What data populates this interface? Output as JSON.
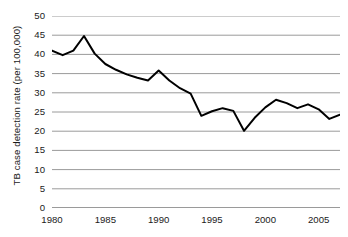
{
  "chart_data": {
    "type": "line",
    "title": "",
    "xlabel": "",
    "ylabel": "TB case detection rate (per 100,000)",
    "xlim": [
      1980,
      2007
    ],
    "ylim": [
      0,
      50
    ],
    "grid": true,
    "legend": "none",
    "y_ticks": [
      0,
      5,
      10,
      15,
      20,
      25,
      30,
      35,
      40,
      45,
      50
    ],
    "y_tick_labels": [
      "0",
      "5",
      "10",
      "15",
      "20",
      "25",
      "30",
      "35",
      "40",
      "45",
      "50"
    ],
    "x_ticks": [
      1980,
      1985,
      1990,
      1995,
      2000,
      2005
    ],
    "x_tick_labels": [
      "1980",
      "1985",
      "1990",
      "1995",
      "2000",
      "2005"
    ],
    "series": [
      {
        "name": "TB case detection rate",
        "color": "#000000",
        "x": [
          1980,
          1981,
          1982,
          1983,
          1984,
          1985,
          1986,
          1987,
          1988,
          1989,
          1990,
          1991,
          1992,
          1993,
          1994,
          1995,
          1996,
          1997,
          1998,
          1999,
          2000,
          2001,
          2002,
          2003,
          2004,
          2005,
          2006,
          2007
        ],
        "values": [
          41.0,
          39.8,
          41.0,
          44.8,
          40.2,
          37.5,
          36.0,
          34.8,
          33.9,
          33.2,
          35.8,
          33.2,
          31.2,
          29.8,
          24.0,
          25.2,
          26.0,
          25.3,
          20.1,
          23.5,
          26.2,
          28.2,
          27.3,
          26.0,
          27.0,
          25.7,
          23.2,
          24.3
        ]
      }
    ]
  }
}
